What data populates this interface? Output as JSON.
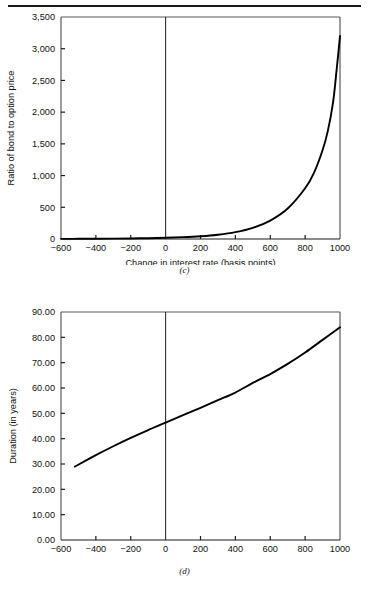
{
  "page": {
    "background_color": "#ffffff",
    "rule_color": "#1a1a1a"
  },
  "figures": [
    {
      "id": "c",
      "caption": "(c)"
    },
    {
      "id": "d",
      "caption": "(d)"
    }
  ],
  "chart_data": [
    {
      "type": "line",
      "panel": "(c)",
      "title": "",
      "xlabel": "Change in interest rate (basis points)",
      "ylabel": "Ratio of bond to option price",
      "xlim": [
        -600,
        1000
      ],
      "ylim": [
        0,
        3500
      ],
      "xticks": [
        -600,
        -400,
        -200,
        0,
        200,
        400,
        600,
        800,
        1000
      ],
      "xticklabels": [
        "−600",
        "−400",
        "−200",
        "0",
        "200",
        "400",
        "600",
        "800",
        "1000"
      ],
      "yticks": [
        0,
        500,
        1000,
        1500,
        2000,
        2500,
        3000,
        3500
      ],
      "yticklabels": [
        "0",
        "500",
        "1,000",
        "1,500",
        "2,000",
        "2,500",
        "3,000",
        "3,500"
      ],
      "grid": false,
      "legend": "none",
      "zero_line": true,
      "line_color": "#000000",
      "x": [
        -600,
        -500,
        -400,
        -300,
        -200,
        -100,
        0,
        100,
        200,
        300,
        400,
        500,
        600,
        700,
        800,
        850,
        900,
        930,
        960,
        980,
        990,
        1000
      ],
      "values": [
        2,
        3,
        4,
        6,
        9,
        13,
        19,
        29,
        44,
        68,
        108,
        175,
        290,
        480,
        800,
        1040,
        1400,
        1700,
        2150,
        2650,
        2920,
        3200
      ]
    },
    {
      "type": "line",
      "panel": "(d)",
      "title": "",
      "xlabel": "Change in interest rate (basis points)",
      "ylabel": "Duration (in years)",
      "xlim": [
        -600,
        1000
      ],
      "ylim": [
        0,
        90
      ],
      "xticks": [
        -600,
        -400,
        -200,
        0,
        200,
        400,
        600,
        800,
        1000
      ],
      "xticklabels": [
        "−600",
        "−400",
        "−200",
        "0",
        "200",
        "400",
        "600",
        "800",
        "1000"
      ],
      "yticks": [
        0,
        10,
        20,
        30,
        40,
        50,
        60,
        70,
        80,
        90
      ],
      "yticklabels": [
        "0.00",
        "10.00",
        "20.00",
        "30.00",
        "40.00",
        "50.00",
        "60.00",
        "70.00",
        "80.00",
        "90.00"
      ],
      "grid": false,
      "legend": "none",
      "zero_line": true,
      "line_color": "#000000",
      "x": [
        -520,
        -400,
        -300,
        -200,
        -100,
        0,
        100,
        200,
        300,
        400,
        500,
        600,
        700,
        800,
        900,
        1000
      ],
      "values": [
        29.0,
        33.5,
        37.0,
        40.3,
        43.4,
        46.3,
        49.3,
        52.2,
        55.2,
        58.2,
        62.0,
        65.5,
        69.5,
        74.0,
        79.0,
        84.0
      ]
    }
  ]
}
